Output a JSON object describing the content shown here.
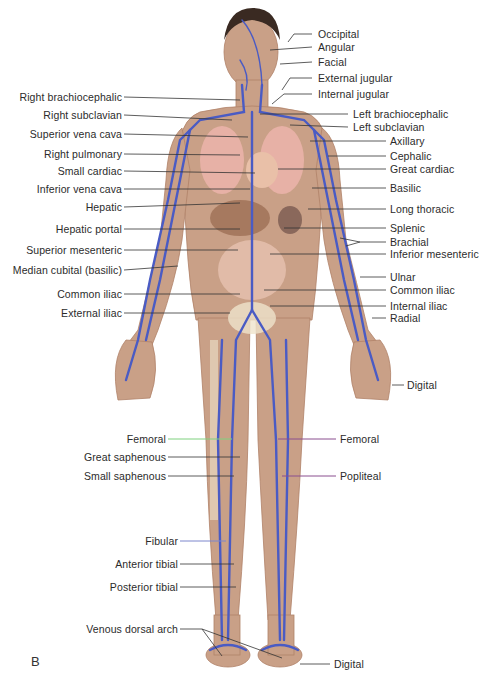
{
  "figure": {
    "panel_letter": "B",
    "colors": {
      "skin": "#c9a087",
      "skin_dark": "#b08268",
      "vein": "#4a5bc4",
      "leader": "#333333",
      "leader_green": "#7fd17f",
      "leader_blue": "#7d86cc",
      "leader_purple": "#8a4f8f",
      "organ_pink": "#e7b1a6",
      "liver": "#9e6f55",
      "bone": "#efe3cc"
    },
    "labels_left": [
      {
        "id": "right-brachiocephalic",
        "text": "Right brachiocephalic",
        "y": 97
      },
      {
        "id": "right-subclavian",
        "text": "Right subclavian",
        "y": 115
      },
      {
        "id": "superior-vena-cava",
        "text": "Superior vena cava",
        "y": 134
      },
      {
        "id": "right-pulmonary",
        "text": "Right pulmonary",
        "y": 154
      },
      {
        "id": "small-cardiac",
        "text": "Small cardiac",
        "y": 171
      },
      {
        "id": "inferior-vena-cava",
        "text": "Inferior vena cava",
        "y": 189
      },
      {
        "id": "hepatic",
        "text": "Hepatic",
        "y": 207
      },
      {
        "id": "hepatic-portal",
        "text": "Hepatic portal",
        "y": 229
      },
      {
        "id": "superior-mesenteric",
        "text": "Superior mesenteric",
        "y": 250
      },
      {
        "id": "median-cubital",
        "text": "Median cubital (basilic)",
        "y": 270
      },
      {
        "id": "common-iliac-left",
        "text": "Common iliac",
        "y": 294
      },
      {
        "id": "external-iliac",
        "text": "External iliac",
        "y": 313
      },
      {
        "id": "femoral-left",
        "text": "Femoral",
        "y": 439
      },
      {
        "id": "great-saphenous",
        "text": "Great saphenous",
        "y": 457
      },
      {
        "id": "small-saphenous",
        "text": "Small saphenous",
        "y": 476
      },
      {
        "id": "fibular",
        "text": "Fibular",
        "y": 541
      },
      {
        "id": "anterior-tibial",
        "text": "Anterior tibial",
        "y": 564
      },
      {
        "id": "posterior-tibial",
        "text": "Posterior tibial",
        "y": 587
      },
      {
        "id": "venous-dorsal-arch",
        "text": "Venous dorsal arch",
        "y": 629
      }
    ],
    "labels_right": [
      {
        "id": "occipital",
        "text": "Occipital",
        "y": 34
      },
      {
        "id": "angular",
        "text": "Angular",
        "y": 47
      },
      {
        "id": "facial",
        "text": "Facial",
        "y": 62
      },
      {
        "id": "external-jugular",
        "text": "External jugular",
        "y": 78
      },
      {
        "id": "internal-jugular",
        "text": "Internal jugular",
        "y": 94
      },
      {
        "id": "left-brachiocephalic",
        "text": "Left brachiocephalic",
        "y": 114
      },
      {
        "id": "left-subclavian",
        "text": "Left subclavian",
        "y": 127
      },
      {
        "id": "axillary",
        "text": "Axillary",
        "y": 141
      },
      {
        "id": "cephalic",
        "text": "Cephalic",
        "y": 156
      },
      {
        "id": "great-cardiac",
        "text": "Great cardiac",
        "y": 169
      },
      {
        "id": "basilic",
        "text": "Basilic",
        "y": 188
      },
      {
        "id": "long-thoracic",
        "text": "Long thoracic",
        "y": 209
      },
      {
        "id": "splenic",
        "text": "Splenic",
        "y": 228
      },
      {
        "id": "brachial",
        "text": "Brachial",
        "y": 242
      },
      {
        "id": "inferior-mesenteric",
        "text": "Inferior mesenteric",
        "y": 254
      },
      {
        "id": "ulnar",
        "text": "Ulnar",
        "y": 277
      },
      {
        "id": "common-iliac-right",
        "text": "Common iliac",
        "y": 290
      },
      {
        "id": "internal-iliac",
        "text": "Internal iliac",
        "y": 306
      },
      {
        "id": "radial",
        "text": "Radial",
        "y": 318
      },
      {
        "id": "digital-hand",
        "text": "Digital",
        "y": 385
      },
      {
        "id": "femoral-right",
        "text": "Femoral",
        "y": 439
      },
      {
        "id": "popliteal",
        "text": "Popliteal",
        "y": 476
      },
      {
        "id": "digital-foot",
        "text": "Digital",
        "y": 664
      }
    ]
  }
}
